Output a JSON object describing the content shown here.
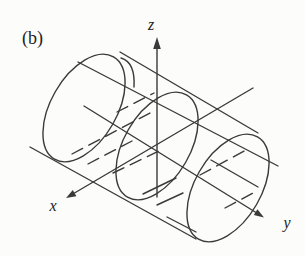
{
  "figure": {
    "panel_label": "(b)",
    "axis_labels": {
      "x": "x",
      "y": "y",
      "z": "z"
    }
  },
  "colors": {
    "ink": "#3a3a3a",
    "text": "#222222",
    "background": "#fcfcfb"
  }
}
